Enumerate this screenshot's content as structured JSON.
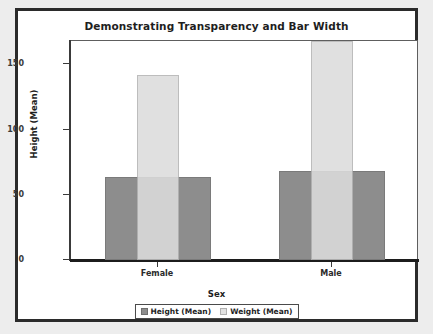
{
  "chart_data": {
    "type": "bar",
    "title": "Demonstrating Transparency and Bar Width",
    "xlabel": "Sex",
    "ylabel": "Height (Mean)",
    "categories": [
      "Female",
      "Male"
    ],
    "series": [
      {
        "name": "Height (Mean)",
        "values": [
          64,
          68
        ],
        "color": "#8d8d8d",
        "bar_width": "wide"
      },
      {
        "name": "Weight (Mean)",
        "values": [
          142,
          168
        ],
        "color": "#dcdcdc",
        "bar_width": "narrow"
      }
    ],
    "ylim": [
      0,
      168
    ],
    "yticks": [
      0,
      50,
      100,
      150
    ],
    "ytick_labels": [
      "0",
      "50",
      "100",
      "150"
    ],
    "grid": false,
    "legend_position": "bottom-center",
    "legend_entries": [
      "Height (Mean)",
      "Weight (Mean)"
    ]
  },
  "legend": {
    "items": [
      {
        "label": "Height (Mean)",
        "swatch": "legend-swatch-height"
      },
      {
        "label": "Weight (Mean)",
        "swatch": "legend-swatch-weight"
      }
    ]
  }
}
